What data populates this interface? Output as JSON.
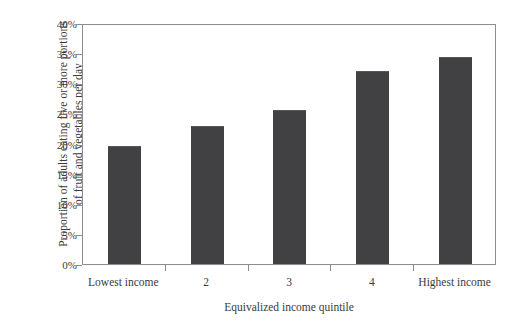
{
  "chart_data": {
    "type": "bar",
    "title": "",
    "categories": [
      "Lowest income",
      "2",
      "3",
      "4",
      "Highest income"
    ],
    "values": [
      19.6,
      22.9,
      25.6,
      32.1,
      34.4
    ],
    "value_labels": [
      "19.6%",
      "22.9%",
      "25.6%",
      "32.1%",
      "34.4%"
    ],
    "xlabel": "Equivalized income quintile",
    "ylabel_line1": "Proportion of adults eating five or more portions",
    "ylabel_line2": "of fruit and vegetables per day",
    "ylabel": "Proportion of adults eating five or more portions of fruit and vegetables per day",
    "ylim": [
      0,
      40
    ],
    "ytick_values": [
      0,
      5,
      10,
      15,
      20,
      25,
      30,
      35,
      40
    ],
    "ytick_labels": [
      "0%",
      "5%",
      "10%",
      "15%",
      "20%",
      "25%",
      "30%",
      "35%",
      "40%"
    ],
    "grid": false,
    "legend": null,
    "bar_color": "#414144",
    "axis_color": "#8d8d91",
    "background_color": "#ffffff"
  }
}
